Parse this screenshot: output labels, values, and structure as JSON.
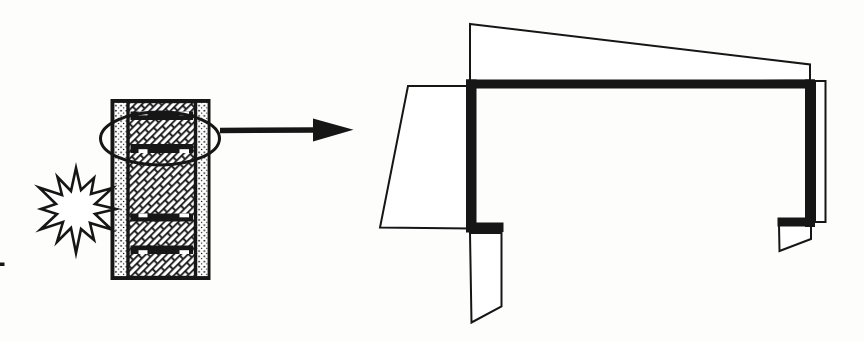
{
  "meta": {
    "figure_kind": "scanned line diagram",
    "background": "#fdfdfb",
    "ink": "#161616",
    "white": "#ffffff"
  },
  "canvas": {
    "width": 864,
    "height": 341,
    "viewbox": "0 0 864 341"
  },
  "shapes": [
    {
      "el": "rect",
      "name": "wall-outer-frame",
      "attrs": {
        "x": 112,
        "y": 100.5,
        "width": 97,
        "height": 178,
        "fill": "#ffffff",
        "stroke": "#161616",
        "stroke-width": 3
      }
    },
    {
      "el": "rect",
      "name": "wall-outer-leaf-left",
      "attrs": {
        "x": 113.5,
        "y": 102,
        "width": 14.5,
        "height": 175,
        "fill": "url(#pat-dots)",
        "stroke": "#161616",
        "stroke-width": 1.8
      }
    },
    {
      "el": "rect",
      "name": "wall-outer-leaf-right",
      "attrs": {
        "x": 195.5,
        "y": 102,
        "width": 13,
        "height": 175,
        "fill": "url(#pat-dots)",
        "stroke": "#161616",
        "stroke-width": 1.8
      }
    },
    {
      "el": "rect",
      "name": "wall-core-masonry",
      "attrs": {
        "x": 128,
        "y": 101.5,
        "width": 67.5,
        "height": 176,
        "fill": "url(#pat-brick)",
        "stroke": "#161616",
        "stroke-width": 3.4
      }
    },
    {
      "el": "rect",
      "name": "steel-track-1",
      "attrs": {
        "x": 130.5,
        "y": 111.5,
        "width": 62.5,
        "height": 8.5,
        "fill": "#161616"
      }
    },
    {
      "el": "rect",
      "name": "track-1-notch-left",
      "attrs": {
        "x": 138.5,
        "y": 111.5,
        "width": 9,
        "height": 3.8,
        "fill": "#ffffff"
      }
    },
    {
      "el": "rect",
      "name": "track-1-notch-right",
      "attrs": {
        "x": 179.5,
        "y": 111.5,
        "width": 9.5,
        "height": 3.8,
        "fill": "#ffffff"
      }
    },
    {
      "el": "rect",
      "name": "steel-track-2",
      "attrs": {
        "x": 130.5,
        "y": 144,
        "width": 62.5,
        "height": 9,
        "fill": "#161616"
      }
    },
    {
      "el": "rect",
      "name": "track-2-notch-left",
      "attrs": {
        "x": 138.5,
        "y": 149.2,
        "width": 9,
        "height": 3.8,
        "fill": "#ffffff"
      }
    },
    {
      "el": "rect",
      "name": "track-2-notch-right",
      "attrs": {
        "x": 179.5,
        "y": 149.2,
        "width": 9.5,
        "height": 3.8,
        "fill": "#ffffff"
      }
    },
    {
      "el": "rect",
      "name": "steel-track-3",
      "attrs": {
        "x": 130.5,
        "y": 213.5,
        "width": 62.5,
        "height": 8,
        "fill": "#161616"
      }
    },
    {
      "el": "rect",
      "name": "track-3-notch-left",
      "attrs": {
        "x": 138.5,
        "y": 213.5,
        "width": 9,
        "height": 3.8,
        "fill": "#ffffff"
      }
    },
    {
      "el": "rect",
      "name": "track-3-notch-right",
      "attrs": {
        "x": 179.5,
        "y": 213.5,
        "width": 9.5,
        "height": 3.8,
        "fill": "#ffffff"
      }
    },
    {
      "el": "rect",
      "name": "steel-track-4",
      "attrs": {
        "x": 130.5,
        "y": 245.5,
        "width": 62.5,
        "height": 8.5,
        "fill": "#161616"
      }
    },
    {
      "el": "rect",
      "name": "track-4-notch-left",
      "attrs": {
        "x": 138.5,
        "y": 250.2,
        "width": 9,
        "height": 3.8,
        "fill": "#ffffff"
      }
    },
    {
      "el": "rect",
      "name": "track-4-notch-right",
      "attrs": {
        "x": 179.5,
        "y": 250.2,
        "width": 9.5,
        "height": 3.8,
        "fill": "#ffffff"
      }
    },
    {
      "el": "polygon",
      "name": "impact-burst-icon",
      "attrs": {
        "points": "116,209 95,214 111.5,229.5 90,223 94,240 81,229 76,253 71,228 57,242 63,222 40.5,229.5 57,214 41,209 56,204 39,187.5 62,195 57.5,177 71,191 76,168 81,190 94,177.8 91,194 112.4,188 95,204",
        "fill": "#ffffff",
        "stroke": "#161616",
        "stroke-width": 2.6,
        "stroke-linejoin": "miter",
        "stroke-miterlimit": "7"
      }
    },
    {
      "el": "ellipse",
      "name": "detail-callout-ellipse",
      "attrs": {
        "cx": 160,
        "cy": 138.5,
        "rx": 59.5,
        "ry": 26.5,
        "fill": "none",
        "stroke": "#161616",
        "stroke-width": 3
      }
    },
    {
      "el": "line",
      "name": "leader-arrow-shaft",
      "attrs": {
        "x1": 220,
        "y1": 130.5,
        "x2": 316,
        "y2": 130,
        "stroke": "#161616",
        "stroke-width": 5.5
      }
    },
    {
      "el": "polygon",
      "name": "leader-arrow-head-icon",
      "attrs": {
        "points": "313,118.5 353.5,129.8 313,141.5",
        "fill": "#161616"
      }
    },
    {
      "el": "polygon",
      "name": "deformed-flange-top",
      "attrs": {
        "points": "470,24 810,64.5 810,80.5 470,84",
        "fill": "#ffffff",
        "stroke": "#161616",
        "stroke-width": 2
      }
    },
    {
      "el": "polygon",
      "name": "deformed-web-left",
      "attrs": {
        "points": "408,86 470,86 470,228.5 380,227.5",
        "fill": "#ffffff",
        "stroke": "#161616",
        "stroke-width": 2
      }
    },
    {
      "el": "polygon",
      "name": "deformed-flap-bottom-left",
      "attrs": {
        "points": "470,233 501.5,233 501.5,306.5 471.5,322.5",
        "fill": "#ffffff",
        "stroke": "#161616",
        "stroke-width": 2
      }
    },
    {
      "el": "polygon",
      "name": "deformed-web-right",
      "attrs": {
        "points": "815,81 825.5,81 825.5,222 815,222",
        "fill": "#ffffff",
        "stroke": "#161616",
        "stroke-width": 2
      }
    },
    {
      "el": "polygon",
      "name": "deformed-flap-bottom-right",
      "attrs": {
        "points": "779,225 811,225 811,239 779.5,251",
        "fill": "#ffffff",
        "stroke": "#161616",
        "stroke-width": 2
      }
    },
    {
      "el": "rect",
      "name": "track-detail-top-flange",
      "attrs": {
        "x": 466,
        "y": 79.5,
        "width": 349,
        "height": 9,
        "fill": "#161616"
      }
    },
    {
      "el": "rect",
      "name": "track-detail-left-leg",
      "attrs": {
        "x": 466,
        "y": 79.5,
        "width": 10.5,
        "height": 153,
        "fill": "#161616"
      }
    },
    {
      "el": "rect",
      "name": "track-detail-right-leg",
      "attrs": {
        "x": 805,
        "y": 79.5,
        "width": 10,
        "height": 147.5,
        "fill": "#161616"
      }
    },
    {
      "el": "rect",
      "name": "track-detail-left-foot",
      "attrs": {
        "x": 466,
        "y": 222.5,
        "width": 37.5,
        "height": 9.5,
        "fill": "#161616"
      }
    },
    {
      "el": "rect",
      "name": "track-detail-right-foot",
      "attrs": {
        "x": 777.5,
        "y": 217.5,
        "width": 37.5,
        "height": 9,
        "fill": "#161616"
      }
    },
    {
      "el": "rect",
      "name": "scan-artifact-speck",
      "attrs": {
        "x": 0,
        "y": 262.5,
        "width": 4.5,
        "height": 3.5,
        "fill": "#161616"
      }
    }
  ]
}
